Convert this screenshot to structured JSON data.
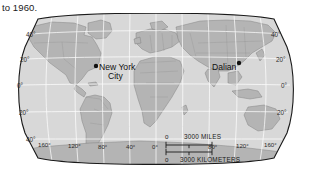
{
  "caption": "to 1960.",
  "map": {
    "projection": "robinson",
    "ocean_color": "#d9d9d9",
    "land_color": "#b5b5b5",
    "border_color": "#8a8a8a",
    "graticule_color": "#ffffff",
    "frame_color": "#1a1a1a",
    "cities": [
      {
        "name": "New York",
        "name2": "City",
        "label": "New York City",
        "marker": "dot",
        "dot_x": 96,
        "dot_y": 53,
        "label_x": 99,
        "label_y": 56
      },
      {
        "name": "Dalian",
        "name2": "",
        "label": "Dalian",
        "marker": "dot",
        "dot_x": 239,
        "dot_y": 51,
        "label_x": 213,
        "label_y": 58
      }
    ],
    "latitude_labels_left": [
      "40°",
      "20°",
      "0°",
      "20°",
      "40°"
    ],
    "latitude_labels_right": [
      "40°",
      "20°",
      "0°",
      "20°"
    ],
    "longitude_labels": [
      "160°",
      "120°",
      "80°",
      "40°",
      "0°",
      "80°",
      "120°",
      "160°"
    ],
    "scale_bars": [
      {
        "zero": "0",
        "label": "3000 MILES"
      },
      {
        "zero": "0",
        "label": "3000 KILOMETERS"
      }
    ]
  }
}
